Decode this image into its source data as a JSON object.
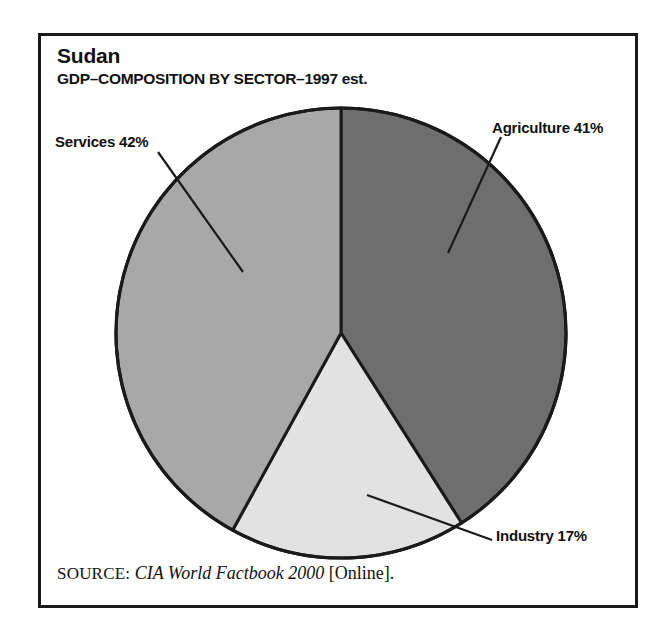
{
  "chart_data": {
    "type": "pie",
    "title": "Sudan",
    "subtitle": "GDP–COMPOSITION BY SECTOR–1997 est.",
    "categories": [
      "Agriculture",
      "Industry",
      "Services"
    ],
    "values": [
      41,
      17,
      42
    ],
    "value_unit": "%",
    "labels": [
      "Agriculture 41%",
      "Industry 17%",
      "Services 42%"
    ],
    "slice_colors": [
      "#6e6e6e",
      "#e2e2e2",
      "#a8a8a8"
    ],
    "slice_border_color": "#1a1a1a",
    "start_angle_deg": 0,
    "direction": "clockwise",
    "legend": "none",
    "grid": false,
    "xlabel": "",
    "ylabel": ""
  },
  "figure": {
    "title": "Sudan",
    "subtitle": "GDP–COMPOSITION BY SECTOR–1997 est.",
    "frame_color": "#1a1a1a",
    "background": "#ffffff"
  },
  "slices": {
    "agriculture": {
      "name": "Agriculture",
      "label": "Agriculture 41%",
      "value": 41,
      "color": "#6e6e6e"
    },
    "industry": {
      "name": "Industry",
      "label": "Industry 17%",
      "value": 17,
      "color": "#e2e2e2"
    },
    "services": {
      "name": "Services",
      "label": "Services 42%",
      "value": 42,
      "color": "#a8a8a8"
    }
  },
  "source": {
    "label": "SOURCE:",
    "work": "CIA World Factbook 2000",
    "suffix": "[Online]."
  }
}
